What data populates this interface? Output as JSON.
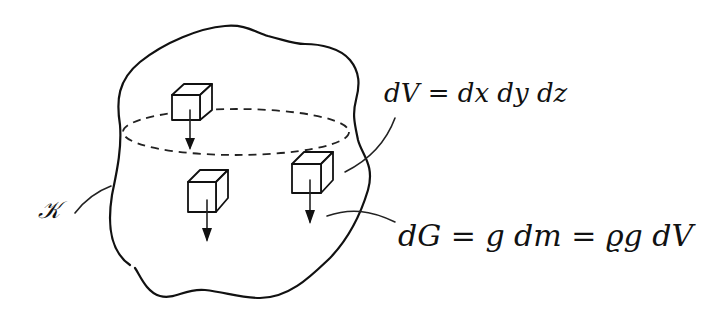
{
  "diagram": {
    "type": "hand-drawn physics sketch",
    "body_label": "𝒦",
    "volume_element_label": "dV = dx dy dz",
    "weight_element_label": "dG = g dm = ϱg dV",
    "elements": [
      {
        "name": "volume-element-top",
        "shape": "cube",
        "arrow": "down"
      },
      {
        "name": "volume-element-lower-left",
        "shape": "cube",
        "arrow": "down"
      },
      {
        "name": "volume-element-right",
        "shape": "cube",
        "arrow": "down"
      }
    ],
    "cross_section": "dashed ellipse",
    "colors": {
      "ink": "#111111",
      "background": "#ffffff"
    }
  }
}
